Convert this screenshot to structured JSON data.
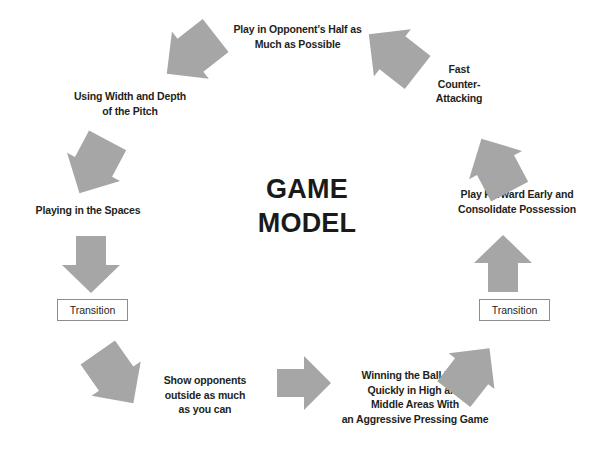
{
  "diagram": {
    "title": "GAME\nMODEL",
    "arrow_color": "#a6a6a6",
    "text_color": "#231f20",
    "background": "#ffffff",
    "nodes": [
      {
        "id": "play-opponents-half",
        "label": "Play in Opponent’s Half as\nMuch as Possible"
      },
      {
        "id": "fast-counter-attacking",
        "label": "Fast\nCounter-\nAttacking"
      },
      {
        "id": "play-forward-early",
        "label": "Play Forward Early and\nConsolidate Possession"
      },
      {
        "id": "transition-right",
        "label": "Transition"
      },
      {
        "id": "winning-ball-back",
        "label": "Winning the Ball Back\nQuickly in High and\nMiddle Areas With\nan Aggressive Pressing Game"
      },
      {
        "id": "show-opponents-outside",
        "label": "Show opponents\noutside as much\nas you can"
      },
      {
        "id": "transition-left",
        "label": "Transition"
      },
      {
        "id": "playing-in-the-spaces",
        "label": "Playing in the Spaces"
      },
      {
        "id": "using-width-and-depth",
        "label": "Using Width and Depth\nof the Pitch"
      }
    ],
    "arrows": [
      {
        "id": "arrow-bottom-right",
        "shape": "chevron",
        "direction": "up-right"
      },
      {
        "id": "arrow-right-up",
        "shape": "block-arrow",
        "direction": "up"
      },
      {
        "id": "arrow-right-upper",
        "shape": "chevron",
        "direction": "up-left"
      },
      {
        "id": "arrow-top-right",
        "shape": "chevron",
        "direction": "up-left"
      },
      {
        "id": "arrow-top-left",
        "shape": "chevron",
        "direction": "down-left"
      },
      {
        "id": "arrow-left-upper",
        "shape": "chevron",
        "direction": "down-right"
      },
      {
        "id": "arrow-left-down",
        "shape": "block-arrow",
        "direction": "down"
      },
      {
        "id": "arrow-bottom-left",
        "shape": "chevron",
        "direction": "down-right"
      },
      {
        "id": "arrow-bottom-center",
        "shape": "block-arrow",
        "direction": "right"
      }
    ]
  }
}
